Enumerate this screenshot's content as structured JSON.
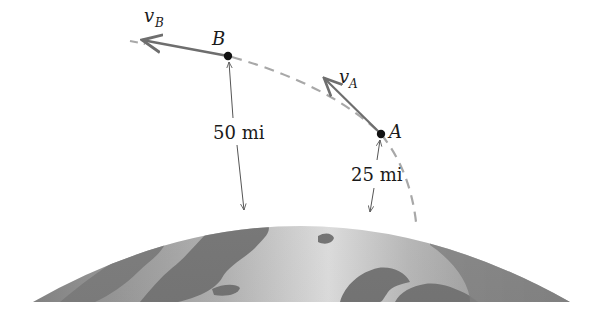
{
  "figure": {
    "type": "orbital-trajectory-diagram",
    "colors": {
      "earth_dark": "#8a8a8a",
      "earth_light": "#e6e6e6",
      "land": "#7a7a7a",
      "trajectory_dashed": "#a8a8a8",
      "velocity_arrow": "#707070",
      "dimension_line": "#555555",
      "point": "#111111"
    },
    "points": [
      {
        "id": "B",
        "label": "B",
        "x": 228,
        "y": 56
      },
      {
        "id": "A",
        "label": "A",
        "x": 381,
        "y": 134
      }
    ],
    "velocities": [
      {
        "id": "vB",
        "symbol": "v",
        "subscript": "B",
        "at": "B"
      },
      {
        "id": "vA",
        "symbol": "v",
        "subscript": "A",
        "at": "A"
      }
    ],
    "dimensions": [
      {
        "id": "alt-B",
        "label": "50 mi",
        "from": "B",
        "to": "earth-surface"
      },
      {
        "id": "alt-A",
        "label": "25 mi",
        "from": "A",
        "to": "earth-surface"
      }
    ],
    "body": {
      "name": "Earth"
    }
  }
}
